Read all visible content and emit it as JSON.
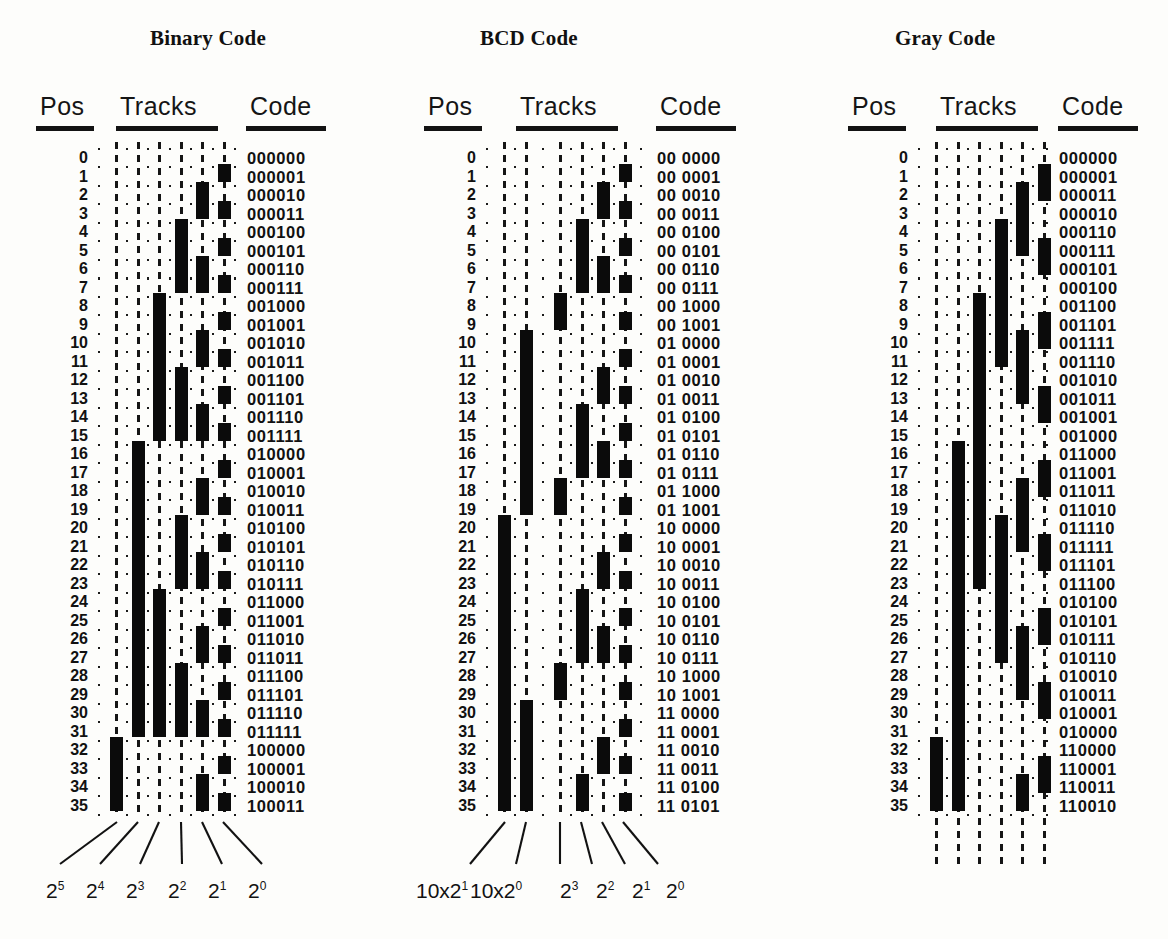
{
  "figure": {
    "kind": "absolute-encoder-track-patterns",
    "row_count": 36,
    "panels": [
      {
        "id": "binary",
        "title": "Binary Code",
        "headers": {
          "pos": "Pos",
          "tracks": "Tracks",
          "code": "Code"
        },
        "positions": [
          0,
          1,
          2,
          3,
          4,
          5,
          6,
          7,
          8,
          9,
          10,
          11,
          12,
          13,
          14,
          15,
          16,
          17,
          18,
          19,
          20,
          21,
          22,
          23,
          24,
          25,
          26,
          27,
          28,
          29,
          30,
          31,
          32,
          33,
          34,
          35
        ],
        "track_labels": [
          "2⁵",
          "2⁴",
          "2³",
          "2²",
          "2¹",
          "2⁰"
        ],
        "track_label_bases": [
          "2",
          "2",
          "2",
          "2",
          "2",
          "2"
        ],
        "track_label_exponents": [
          "5",
          "4",
          "3",
          "2",
          "1",
          "0"
        ],
        "track_count": 6,
        "codes": [
          "000000",
          "000001",
          "000010",
          "000011",
          "000100",
          "000101",
          "000110",
          "000111",
          "001000",
          "001001",
          "001010",
          "001011",
          "001100",
          "001101",
          "001110",
          "001111",
          "010000",
          "010001",
          "010010",
          "010011",
          "010100",
          "010101",
          "010110",
          "010111",
          "011000",
          "011001",
          "011010",
          "011011",
          "011100",
          "011101",
          "011110",
          "011111",
          "100000",
          "100001",
          "100010",
          "100011"
        ],
        "bits": [
          [
            0,
            0,
            0,
            0,
            0,
            0
          ],
          [
            0,
            0,
            0,
            0,
            0,
            1
          ],
          [
            0,
            0,
            0,
            0,
            1,
            0
          ],
          [
            0,
            0,
            0,
            0,
            1,
            1
          ],
          [
            0,
            0,
            0,
            1,
            0,
            0
          ],
          [
            0,
            0,
            0,
            1,
            0,
            1
          ],
          [
            0,
            0,
            0,
            1,
            1,
            0
          ],
          [
            0,
            0,
            0,
            1,
            1,
            1
          ],
          [
            0,
            0,
            1,
            0,
            0,
            0
          ],
          [
            0,
            0,
            1,
            0,
            0,
            1
          ],
          [
            0,
            0,
            1,
            0,
            1,
            0
          ],
          [
            0,
            0,
            1,
            0,
            1,
            1
          ],
          [
            0,
            0,
            1,
            1,
            0,
            0
          ],
          [
            0,
            0,
            1,
            1,
            0,
            1
          ],
          [
            0,
            0,
            1,
            1,
            1,
            0
          ],
          [
            0,
            0,
            1,
            1,
            1,
            1
          ],
          [
            0,
            1,
            0,
            0,
            0,
            0
          ],
          [
            0,
            1,
            0,
            0,
            0,
            1
          ],
          [
            0,
            1,
            0,
            0,
            1,
            0
          ],
          [
            0,
            1,
            0,
            0,
            1,
            1
          ],
          [
            0,
            1,
            0,
            1,
            0,
            0
          ],
          [
            0,
            1,
            0,
            1,
            0,
            1
          ],
          [
            0,
            1,
            0,
            1,
            1,
            0
          ],
          [
            0,
            1,
            0,
            1,
            1,
            1
          ],
          [
            0,
            1,
            1,
            0,
            0,
            0
          ],
          [
            0,
            1,
            1,
            0,
            0,
            1
          ],
          [
            0,
            1,
            1,
            0,
            1,
            0
          ],
          [
            0,
            1,
            1,
            0,
            1,
            1
          ],
          [
            0,
            1,
            1,
            1,
            0,
            0
          ],
          [
            0,
            1,
            1,
            1,
            0,
            1
          ],
          [
            0,
            1,
            1,
            1,
            1,
            0
          ],
          [
            0,
            1,
            1,
            1,
            1,
            1
          ],
          [
            1,
            0,
            0,
            0,
            0,
            0
          ],
          [
            1,
            0,
            0,
            0,
            0,
            1
          ],
          [
            1,
            0,
            0,
            0,
            1,
            0
          ],
          [
            1,
            0,
            0,
            0,
            1,
            1
          ]
        ]
      },
      {
        "id": "bcd",
        "title": "BCD Code",
        "headers": {
          "pos": "Pos",
          "tracks": "Tracks",
          "code": "Code"
        },
        "positions": [
          0,
          1,
          2,
          3,
          4,
          5,
          6,
          7,
          8,
          9,
          10,
          11,
          12,
          13,
          14,
          15,
          16,
          17,
          18,
          19,
          20,
          21,
          22,
          23,
          24,
          25,
          26,
          27,
          28,
          29,
          30,
          31,
          32,
          33,
          34,
          35
        ],
        "track_labels": [
          "10x2¹",
          "10x2⁰",
          "2³",
          "2²",
          "2¹",
          "2⁰"
        ],
        "track_label_bases": [
          "10x2",
          "10x2",
          "2",
          "2",
          "2",
          "2"
        ],
        "track_label_exponents": [
          "1",
          "0",
          "3",
          "2",
          "1",
          "0"
        ],
        "track_count": 6,
        "codes": [
          "00 0000",
          "00 0001",
          "00 0010",
          "00 0011",
          "00 0100",
          "00 0101",
          "00 0110",
          "00 0111",
          "00 1000",
          "00 1001",
          "01 0000",
          "01 0001",
          "01 0010",
          "01 0011",
          "01 0100",
          "01 0101",
          "01 0110",
          "01 0111",
          "01 1000",
          "01 1001",
          "10 0000",
          "10 0001",
          "10 0010",
          "10 0011",
          "10 0100",
          "10 0101",
          "10 0110",
          "10 0111",
          "10 1000",
          "10 1001",
          "11 0000",
          "11 0001",
          "11 0010",
          "11 0011",
          "11 0100",
          "11 0101"
        ],
        "bits": [
          [
            0,
            0,
            0,
            0,
            0,
            0
          ],
          [
            0,
            0,
            0,
            0,
            0,
            1
          ],
          [
            0,
            0,
            0,
            0,
            1,
            0
          ],
          [
            0,
            0,
            0,
            0,
            1,
            1
          ],
          [
            0,
            0,
            0,
            1,
            0,
            0
          ],
          [
            0,
            0,
            0,
            1,
            0,
            1
          ],
          [
            0,
            0,
            0,
            1,
            1,
            0
          ],
          [
            0,
            0,
            0,
            1,
            1,
            1
          ],
          [
            0,
            0,
            1,
            0,
            0,
            0
          ],
          [
            0,
            0,
            1,
            0,
            0,
            1
          ],
          [
            0,
            1,
            0,
            0,
            0,
            0
          ],
          [
            0,
            1,
            0,
            0,
            0,
            1
          ],
          [
            0,
            1,
            0,
            0,
            1,
            0
          ],
          [
            0,
            1,
            0,
            0,
            1,
            1
          ],
          [
            0,
            1,
            0,
            1,
            0,
            0
          ],
          [
            0,
            1,
            0,
            1,
            0,
            1
          ],
          [
            0,
            1,
            0,
            1,
            1,
            0
          ],
          [
            0,
            1,
            0,
            1,
            1,
            1
          ],
          [
            0,
            1,
            1,
            0,
            0,
            0
          ],
          [
            0,
            1,
            1,
            0,
            0,
            1
          ],
          [
            1,
            0,
            0,
            0,
            0,
            0
          ],
          [
            1,
            0,
            0,
            0,
            0,
            1
          ],
          [
            1,
            0,
            0,
            0,
            1,
            0
          ],
          [
            1,
            0,
            0,
            0,
            1,
            1
          ],
          [
            1,
            0,
            0,
            1,
            0,
            0
          ],
          [
            1,
            0,
            0,
            1,
            0,
            1
          ],
          [
            1,
            0,
            0,
            1,
            1,
            0
          ],
          [
            1,
            0,
            0,
            1,
            1,
            1
          ],
          [
            1,
            0,
            1,
            0,
            0,
            0
          ],
          [
            1,
            0,
            1,
            0,
            0,
            1
          ],
          [
            1,
            1,
            0,
            0,
            0,
            0
          ],
          [
            1,
            1,
            0,
            0,
            0,
            1
          ],
          [
            1,
            1,
            0,
            0,
            1,
            0
          ],
          [
            1,
            1,
            0,
            0,
            1,
            1
          ],
          [
            1,
            1,
            0,
            1,
            0,
            0
          ],
          [
            1,
            1,
            0,
            1,
            0,
            1
          ]
        ]
      },
      {
        "id": "gray",
        "title": "Gray Code",
        "headers": {
          "pos": "Pos",
          "tracks": "Tracks",
          "code": "Code"
        },
        "positions": [
          0,
          1,
          2,
          3,
          4,
          5,
          6,
          7,
          8,
          9,
          10,
          11,
          12,
          13,
          14,
          15,
          16,
          17,
          18,
          19,
          20,
          21,
          22,
          23,
          24,
          25,
          26,
          27,
          28,
          29,
          30,
          31,
          32,
          33,
          34,
          35
        ],
        "track_labels": [],
        "track_count": 6,
        "codes": [
          "000000",
          "000001",
          "000011",
          "000010",
          "000110",
          "000111",
          "000101",
          "000100",
          "001100",
          "001101",
          "001111",
          "001110",
          "001010",
          "001011",
          "001001",
          "001000",
          "011000",
          "011001",
          "011011",
          "011010",
          "011110",
          "011111",
          "011101",
          "011100",
          "010100",
          "010101",
          "010111",
          "010110",
          "010010",
          "010011",
          "010001",
          "010000",
          "110000",
          "110001",
          "110011",
          "110010"
        ],
        "bits": [
          [
            0,
            0,
            0,
            0,
            0,
            0
          ],
          [
            0,
            0,
            0,
            0,
            0,
            1
          ],
          [
            0,
            0,
            0,
            0,
            1,
            1
          ],
          [
            0,
            0,
            0,
            0,
            1,
            0
          ],
          [
            0,
            0,
            0,
            1,
            1,
            0
          ],
          [
            0,
            0,
            0,
            1,
            1,
            1
          ],
          [
            0,
            0,
            0,
            1,
            0,
            1
          ],
          [
            0,
            0,
            0,
            1,
            0,
            0
          ],
          [
            0,
            0,
            1,
            1,
            0,
            0
          ],
          [
            0,
            0,
            1,
            1,
            0,
            1
          ],
          [
            0,
            0,
            1,
            1,
            1,
            1
          ],
          [
            0,
            0,
            1,
            1,
            1,
            0
          ],
          [
            0,
            0,
            1,
            0,
            1,
            0
          ],
          [
            0,
            0,
            1,
            0,
            1,
            1
          ],
          [
            0,
            0,
            1,
            0,
            0,
            1
          ],
          [
            0,
            0,
            1,
            0,
            0,
            0
          ],
          [
            0,
            1,
            1,
            0,
            0,
            0
          ],
          [
            0,
            1,
            1,
            0,
            0,
            1
          ],
          [
            0,
            1,
            1,
            0,
            1,
            1
          ],
          [
            0,
            1,
            1,
            0,
            1,
            0
          ],
          [
            0,
            1,
            1,
            1,
            1,
            0
          ],
          [
            0,
            1,
            1,
            1,
            1,
            1
          ],
          [
            0,
            1,
            1,
            1,
            0,
            1
          ],
          [
            0,
            1,
            1,
            1,
            0,
            0
          ],
          [
            0,
            1,
            0,
            1,
            0,
            0
          ],
          [
            0,
            1,
            0,
            1,
            0,
            1
          ],
          [
            0,
            1,
            0,
            1,
            1,
            1
          ],
          [
            0,
            1,
            0,
            1,
            1,
            0
          ],
          [
            0,
            1,
            0,
            0,
            1,
            0
          ],
          [
            0,
            1,
            0,
            0,
            1,
            1
          ],
          [
            0,
            1,
            0,
            0,
            0,
            1
          ],
          [
            0,
            1,
            0,
            0,
            0,
            0
          ],
          [
            1,
            1,
            0,
            0,
            0,
            0
          ],
          [
            1,
            1,
            0,
            0,
            0,
            1
          ],
          [
            1,
            1,
            0,
            0,
            1,
            1
          ],
          [
            1,
            1,
            0,
            0,
            1,
            0
          ]
        ]
      }
    ]
  },
  "colors": {
    "ink": "#0b0b0b",
    "paper": "#fdfdfb"
  },
  "layout": {
    "row_height": 18.5,
    "first_row_y": 150,
    "panel_x": [
      30,
      410,
      840
    ],
    "title_x": [
      150,
      480,
      895
    ],
    "title_y": 26,
    "header_y": 92,
    "rule_y": 126,
    "track_pitch": 21.5
  }
}
